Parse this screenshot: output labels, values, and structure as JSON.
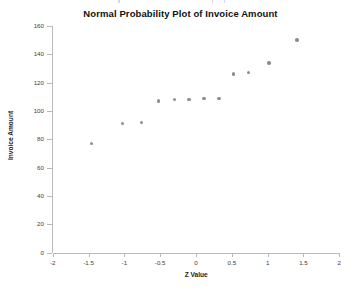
{
  "chart_data": {
    "type": "scatter",
    "title": "Normal Probability Plot of Invoice Amount",
    "xlabel": "Z Value",
    "ylabel": "Invoice Amount",
    "xlim": [
      -2,
      2
    ],
    "ylim": [
      0,
      160
    ],
    "xticks": [
      -2,
      -1.5,
      -1,
      -0.5,
      0,
      0.5,
      1,
      1.5,
      2
    ],
    "xtick_labels": [
      "-2",
      "-1.5",
      "-1",
      "-0.5",
      "0",
      "0.5",
      "1",
      "1.5",
      "2"
    ],
    "yticks": [
      0,
      20,
      40,
      60,
      80,
      100,
      120,
      140,
      160
    ],
    "ytick_labels": [
      "0",
      "20",
      "40",
      "60",
      "80",
      "100",
      "120",
      "140",
      "160"
    ],
    "grid": false,
    "legend": false,
    "marker_color": "#8e8e8e",
    "marker_shape": "circle",
    "series": [
      {
        "name": "Invoice Amount",
        "points": [
          {
            "x": -1.46,
            "y": 77
          },
          {
            "x": -1.03,
            "y": 91
          },
          {
            "x": -0.76,
            "y": 92
          },
          {
            "x": -0.52,
            "y": 107
          },
          {
            "x": -0.3,
            "y": 108
          },
          {
            "x": -0.1,
            "y": 108
          },
          {
            "x": 0.11,
            "y": 109
          },
          {
            "x": 0.32,
            "y": 109
          },
          {
            "x": 0.52,
            "y": 126
          },
          {
            "x": 0.73,
            "y": 127
          },
          {
            "x": 1.02,
            "y": 134
          },
          {
            "x": 1.41,
            "y": 150
          }
        ]
      }
    ]
  }
}
